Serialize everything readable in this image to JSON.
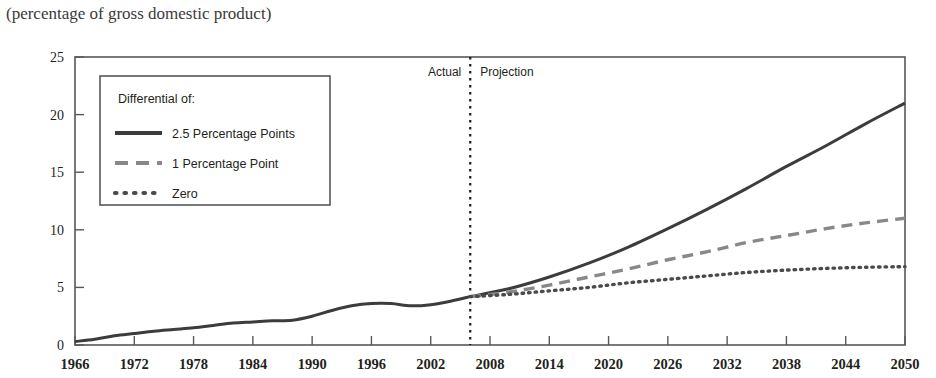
{
  "subtitle": "(percentage of gross domestic product)",
  "divider": {
    "actual_label": "Actual",
    "projection_label": "Projection",
    "year": 2006
  },
  "legend": {
    "title": "Differential of:",
    "items": [
      {
        "label": "2.5 Percentage Points",
        "style": "solid",
        "color": "#3c3c3c"
      },
      {
        "label": "1 Percentage Point",
        "style": "dashed",
        "color": "#888888"
      },
      {
        "label": "Zero",
        "style": "dotted",
        "color": "#4a4a4a"
      }
    ]
  },
  "chart_data": {
    "type": "line",
    "title": "",
    "subtitle": "(percentage of gross domestic product)",
    "xlabel": "",
    "ylabel": "",
    "xlim": [
      1966,
      2050
    ],
    "ylim": [
      0,
      25
    ],
    "yticks": [
      0,
      5,
      10,
      15,
      20,
      25
    ],
    "xticks": [
      1966,
      1972,
      1978,
      1984,
      1990,
      1996,
      2002,
      2008,
      2014,
      2020,
      2026,
      2032,
      2038,
      2044,
      2050
    ],
    "grid": false,
    "legend_position": "upper-left",
    "annotations": [
      {
        "text": "Actual",
        "x": 2003,
        "y": 24
      },
      {
        "text": "Projection",
        "x": 2009,
        "y": 24
      }
    ],
    "series": [
      {
        "name": "Historical",
        "style": "solid",
        "color": "#3c3c3c",
        "x": [
          1966,
          1968,
          1970,
          1972,
          1974,
          1976,
          1978,
          1980,
          1982,
          1984,
          1986,
          1988,
          1990,
          1992,
          1994,
          1996,
          1998,
          2000,
          2002,
          2004,
          2006
        ],
        "values": [
          0.3,
          0.5,
          0.8,
          1.0,
          1.2,
          1.35,
          1.5,
          1.7,
          1.9,
          2.0,
          2.1,
          2.15,
          2.5,
          3.0,
          3.4,
          3.6,
          3.6,
          3.4,
          3.5,
          3.8,
          4.2
        ]
      },
      {
        "name": "2.5 Percentage Points",
        "style": "solid",
        "color": "#3c3c3c",
        "x": [
          2006,
          2010,
          2014,
          2018,
          2022,
          2026,
          2030,
          2034,
          2038,
          2042,
          2046,
          2050
        ],
        "values": [
          4.2,
          4.9,
          5.9,
          7.1,
          8.5,
          10.1,
          11.8,
          13.6,
          15.5,
          17.3,
          19.2,
          21.0
        ]
      },
      {
        "name": "1 Percentage Point",
        "style": "dashed",
        "color": "#888888",
        "x": [
          2006,
          2010,
          2014,
          2018,
          2022,
          2026,
          2030,
          2034,
          2038,
          2042,
          2046,
          2050
        ],
        "values": [
          4.2,
          4.6,
          5.2,
          5.9,
          6.6,
          7.4,
          8.1,
          8.9,
          9.5,
          10.1,
          10.6,
          11.0
        ]
      },
      {
        "name": "Zero",
        "style": "dotted",
        "color": "#4a4a4a",
        "x": [
          2006,
          2010,
          2014,
          2018,
          2022,
          2026,
          2030,
          2034,
          2038,
          2042,
          2046,
          2050
        ],
        "values": [
          4.2,
          4.4,
          4.7,
          5.0,
          5.4,
          5.7,
          6.0,
          6.3,
          6.5,
          6.65,
          6.75,
          6.8
        ]
      }
    ]
  }
}
